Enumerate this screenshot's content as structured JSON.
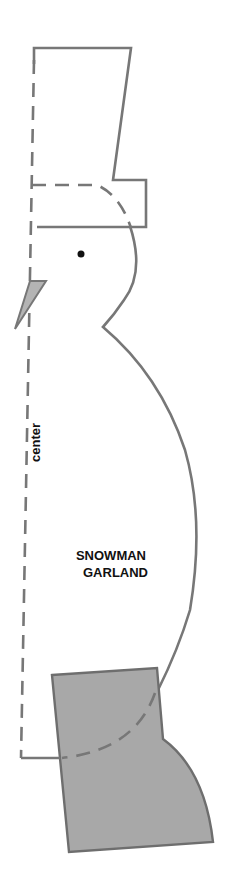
{
  "template": {
    "title_line1": "SNOWMAN",
    "title_line2": "GARLAND",
    "center_label": "center"
  },
  "colors": {
    "outline": "#777777",
    "boot_fill": "#a8a8a8",
    "nose_fill": "#b4b4b4",
    "eye": "#111111",
    "background": "#ffffff"
  },
  "parts": [
    {
      "name": "hat",
      "style": "solid outline with dashed fold line"
    },
    {
      "name": "head",
      "style": "solid outline"
    },
    {
      "name": "eye",
      "style": "filled dot"
    },
    {
      "name": "nose",
      "style": "gray triangle"
    },
    {
      "name": "body",
      "style": "solid outline"
    },
    {
      "name": "boot",
      "style": "gray filled shape"
    },
    {
      "name": "center-fold-line",
      "style": "dashed"
    }
  ]
}
